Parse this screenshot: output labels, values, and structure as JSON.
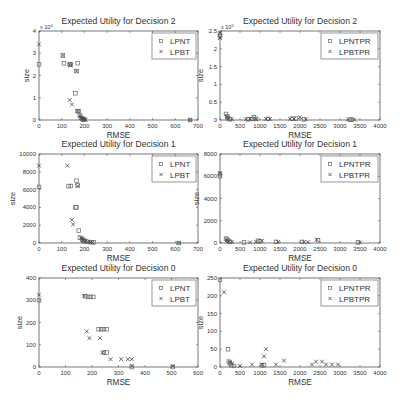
{
  "figure": {
    "width": 406,
    "height": 405,
    "layout": "3x2"
  },
  "chart_data": [
    {
      "id": "tl",
      "type": "scatter",
      "title": "Expected Utility for Decision 2",
      "xlabel": "RMSE",
      "ylabel": "size",
      "xlim": [
        0,
        700
      ],
      "ylim": [
        0,
        40000
      ],
      "xticks": [
        0,
        100,
        200,
        300,
        400,
        500,
        600,
        700
      ],
      "yticks": [
        0,
        10000,
        20000,
        30000,
        40000
      ],
      "ytick_labels": [
        "0",
        "1",
        "2",
        "3",
        "4"
      ],
      "y_multiplier": "x 10^4",
      "legend": {
        "position": "upper right",
        "entries": [
          "LPNT",
          "LPBT"
        ]
      },
      "box": {
        "x0": 39,
        "y0": 31,
        "x1": 198,
        "y1": 120
      },
      "series": [
        {
          "name": "LPNT",
          "marker": "square",
          "points": [
            [
              0,
              25000
            ],
            [
              105,
              29000
            ],
            [
              110,
              25500
            ],
            [
              135,
              25000
            ],
            [
              140,
              25000
            ],
            [
              170,
              25500
            ],
            [
              165,
              22000
            ],
            [
              160,
              12000
            ],
            [
              170,
              4000
            ],
            [
              175,
              4000
            ],
            [
              180,
              2000
            ],
            [
              185,
              1000
            ],
            [
              190,
              500
            ],
            [
              195,
              200
            ],
            [
              200,
              100
            ],
            [
              665,
              0
            ]
          ]
        },
        {
          "name": "LPBT",
          "marker": "x",
          "points": [
            [
              0,
              34000
            ],
            [
              105,
              29000
            ],
            [
              135,
              25000
            ],
            [
              140,
              24500
            ],
            [
              165,
              22000
            ],
            [
              135,
              9000
            ],
            [
              145,
              7000
            ],
            [
              170,
              4000
            ],
            [
              180,
              2000
            ],
            [
              185,
              1000
            ],
            [
              190,
              800
            ],
            [
              195,
              500
            ],
            [
              200,
              300
            ],
            [
              205,
              100
            ],
            [
              665,
              0
            ]
          ]
        }
      ]
    },
    {
      "id": "tr",
      "type": "scatter",
      "title": "Expected Utility for Decision 2",
      "xlabel": "RMSE",
      "ylabel": "size",
      "xlim": [
        0,
        4000
      ],
      "ylim": [
        0,
        250000
      ],
      "xticks": [
        0,
        500,
        1000,
        1500,
        2000,
        2500,
        3000,
        3500,
        4000
      ],
      "yticks": [
        0,
        50000,
        100000,
        150000,
        200000,
        250000
      ],
      "ytick_labels": [
        "0",
        "0.5",
        "1",
        "1.5",
        "2",
        "2.5"
      ],
      "y_multiplier": "x 10^5",
      "legend": {
        "position": "upper right",
        "entries": [
          "LPNTPR",
          "LPBTPR"
        ]
      },
      "box": {
        "x0": 220,
        "y0": 31,
        "x1": 380,
        "y1": 120
      },
      "series": [
        {
          "name": "LPNTPR",
          "marker": "square",
          "points": [
            [
              0,
              240000
            ],
            [
              0,
              235000
            ],
            [
              150,
              17000
            ],
            [
              180,
              10000
            ],
            [
              200,
              5000
            ],
            [
              250,
              2000
            ],
            [
              700,
              2000
            ],
            [
              800,
              3000
            ],
            [
              850,
              8000
            ],
            [
              900,
              3000
            ],
            [
              1200,
              3000
            ],
            [
              1800,
              4000
            ],
            [
              1900,
              4000
            ],
            [
              2100,
              2000
            ],
            [
              3250,
              1000
            ],
            [
              3300,
              1000
            ]
          ]
        },
        {
          "name": "LPBTPR",
          "marker": "x",
          "points": [
            [
              0,
              245000
            ],
            [
              0,
              230000
            ],
            [
              170,
              8000
            ],
            [
              200,
              4000
            ],
            [
              300,
              2000
            ],
            [
              650,
              2000
            ],
            [
              750,
              3000
            ],
            [
              900,
              2000
            ],
            [
              1150,
              3000
            ],
            [
              1250,
              3000
            ],
            [
              1750,
              3000
            ],
            [
              1850,
              3000
            ],
            [
              2000,
              8000
            ],
            [
              2150,
              2000
            ],
            [
              3200,
              1000
            ],
            [
              3350,
              1000
            ]
          ]
        }
      ]
    },
    {
      "id": "ml",
      "type": "scatter",
      "title": "Expected Utility for Decision 1",
      "xlabel": "RMSE",
      "ylabel": "size",
      "xlim": [
        0,
        700
      ],
      "ylim": [
        0,
        10000
      ],
      "xticks": [
        0,
        100,
        200,
        300,
        400,
        500,
        600,
        700
      ],
      "yticks": [
        0,
        2000,
        4000,
        6000,
        8000,
        10000
      ],
      "ytick_labels": [
        "0",
        "2000",
        "4000",
        "6000",
        "8000",
        "10000"
      ],
      "y_multiplier": "",
      "legend": {
        "position": "upper right",
        "entries": [
          "LPNT",
          "LPBT"
        ]
      },
      "box": {
        "x0": 39,
        "y0": 154,
        "x1": 198,
        "y1": 243
      },
      "series": [
        {
          "name": "LPNT",
          "marker": "square",
          "points": [
            [
              0,
              6300
            ],
            [
              130,
              6400
            ],
            [
              140,
              6400
            ],
            [
              165,
              7000
            ],
            [
              170,
              6500
            ],
            [
              160,
              4000
            ],
            [
              165,
              4000
            ],
            [
              175,
              1400
            ],
            [
              180,
              600
            ],
            [
              190,
              400
            ],
            [
              195,
              300
            ],
            [
              200,
              200
            ],
            [
              210,
              150
            ],
            [
              230,
              100
            ],
            [
              240,
              80
            ],
            [
              615,
              0
            ]
          ]
        },
        {
          "name": "LPBT",
          "marker": "x",
          "points": [
            [
              0,
              8700
            ],
            [
              125,
              8700
            ],
            [
              170,
              6400
            ],
            [
              145,
              2600
            ],
            [
              150,
              2100
            ],
            [
              185,
              600
            ],
            [
              190,
              500
            ],
            [
              195,
              300
            ],
            [
              205,
              200
            ],
            [
              215,
              150
            ],
            [
              225,
              100
            ],
            [
              235,
              50
            ],
            [
              615,
              0
            ]
          ]
        }
      ]
    },
    {
      "id": "mr",
      "type": "scatter",
      "title": "Expected Utility for Decision 1",
      "xlabel": "RMSE",
      "ylabel": "size",
      "xlim": [
        0,
        4000
      ],
      "ylim": [
        0,
        8000
      ],
      "xticks": [
        0,
        500,
        1000,
        1500,
        2000,
        2500,
        3000,
        3500,
        4000
      ],
      "yticks": [
        0,
        2000,
        4000,
        6000,
        8000
      ],
      "ytick_labels": [
        "0",
        "2000",
        "4000",
        "6000",
        "8000"
      ],
      "y_multiplier": "",
      "legend": {
        "position": "upper right",
        "entries": [
          "LPNTPR",
          "LPBTPR"
        ]
      },
      "box": {
        "x0": 220,
        "y0": 154,
        "x1": 380,
        "y1": 243
      },
      "series": [
        {
          "name": "LPNTPR",
          "marker": "square",
          "points": [
            [
              0,
              6200
            ],
            [
              0,
              6000
            ],
            [
              150,
              400
            ],
            [
              180,
              300
            ],
            [
              200,
              200
            ],
            [
              250,
              100
            ],
            [
              600,
              50
            ],
            [
              950,
              200
            ],
            [
              1000,
              150
            ],
            [
              1400,
              100
            ],
            [
              2050,
              100
            ],
            [
              2450,
              250
            ],
            [
              3450,
              50
            ]
          ]
        },
        {
          "name": "LPBTPR",
          "marker": "x",
          "points": [
            [
              0,
              6300
            ],
            [
              170,
              250
            ],
            [
              220,
              150
            ],
            [
              300,
              100
            ],
            [
              750,
              50
            ],
            [
              900,
              100
            ],
            [
              1050,
              200
            ],
            [
              1450,
              100
            ],
            [
              2100,
              100
            ],
            [
              2200,
              80
            ],
            [
              2420,
              300
            ],
            [
              3500,
              50
            ]
          ]
        }
      ]
    },
    {
      "id": "bl",
      "type": "scatter",
      "title": "Expected Utility for Decision 0",
      "xlabel": "RMSE",
      "ylabel": "size",
      "xlim": [
        0,
        600
      ],
      "ylim": [
        0,
        400
      ],
      "xticks": [
        0,
        100,
        200,
        300,
        400,
        500,
        600
      ],
      "yticks": [
        0,
        100,
        200,
        300,
        400
      ],
      "ytick_labels": [
        "0",
        "100",
        "200",
        "300",
        "400"
      ],
      "y_multiplier": "",
      "legend": {
        "position": "upper right",
        "entries": [
          "LPNT",
          "LPBT"
        ]
      },
      "box": {
        "x0": 39,
        "y0": 278,
        "x1": 198,
        "y1": 367
      },
      "series": [
        {
          "name": "LPNT",
          "marker": "square",
          "points": [
            [
              0,
              300
            ],
            [
              175,
              318
            ],
            [
              185,
              315
            ],
            [
              195,
              315
            ],
            [
              205,
              315
            ],
            [
              225,
              170
            ],
            [
              235,
              170
            ],
            [
              245,
              170
            ],
            [
              255,
              170
            ],
            [
              245,
              65
            ],
            [
              255,
              65
            ],
            [
              350,
              0
            ],
            [
              505,
              0
            ]
          ]
        },
        {
          "name": "LPBT",
          "marker": "x",
          "points": [
            [
              0,
              325
            ],
            [
              170,
              320
            ],
            [
              180,
              160
            ],
            [
              190,
              130
            ],
            [
              230,
              130
            ],
            [
              240,
              65
            ],
            [
              270,
              35
            ],
            [
              310,
              35
            ],
            [
              335,
              35
            ],
            [
              350,
              35
            ],
            [
              350,
              5
            ],
            [
              505,
              5
            ]
          ]
        }
      ]
    },
    {
      "id": "br",
      "type": "scatter",
      "title": "Expected Utility for Decision 0",
      "xlabel": "RMSE",
      "ylabel": "size",
      "xlim": [
        0,
        4000
      ],
      "ylim": [
        0,
        250
      ],
      "xticks": [
        0,
        500,
        1000,
        1500,
        2000,
        2500,
        3000,
        3500,
        4000
      ],
      "yticks": [
        0,
        50,
        100,
        150,
        200,
        250
      ],
      "ytick_labels": [
        "0",
        "50",
        "100",
        "150",
        "200",
        "250"
      ],
      "y_multiplier": "",
      "legend": {
        "position": "upper right",
        "entries": [
          "LPNTPR",
          "LPBTPR"
        ]
      },
      "box": {
        "x0": 220,
        "y0": 278,
        "x1": 380,
        "y1": 367
      },
      "series": [
        {
          "name": "LPNTPR",
          "marker": "square",
          "points": [
            [
              0,
              245
            ],
            [
              200,
              50
            ],
            [
              220,
              15
            ],
            [
              250,
              10
            ],
            [
              280,
              5
            ],
            [
              350,
              3
            ],
            [
              1050,
              5
            ],
            [
              1100,
              5
            ]
          ]
        },
        {
          "name": "LPBTPR",
          "marker": "x",
          "points": [
            [
              100,
              210
            ],
            [
              250,
              15
            ],
            [
              300,
              10
            ],
            [
              500,
              3
            ],
            [
              800,
              7
            ],
            [
              1050,
              7
            ],
            [
              1100,
              30
            ],
            [
              1150,
              50
            ],
            [
              1400,
              7
            ],
            [
              1600,
              18
            ],
            [
              2300,
              7
            ],
            [
              2400,
              15
            ],
            [
              2550,
              15
            ],
            [
              2650,
              7
            ],
            [
              2800,
              7
            ],
            [
              2950,
              7
            ]
          ]
        }
      ]
    }
  ]
}
